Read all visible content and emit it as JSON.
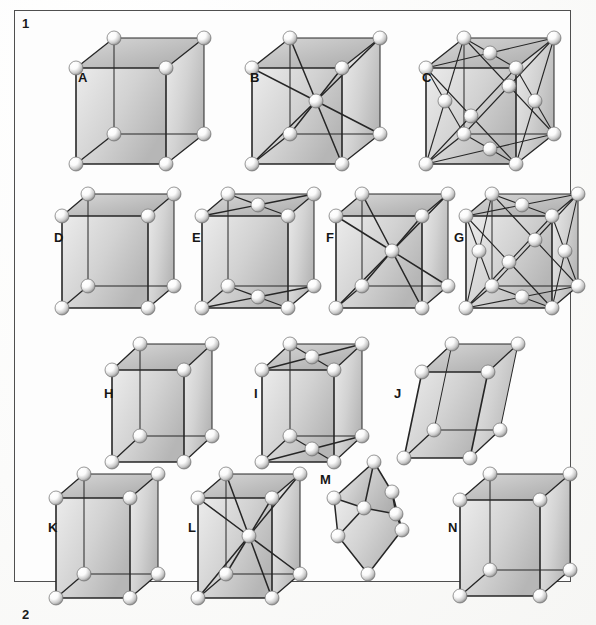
{
  "figure": {
    "number": "1",
    "next_number": "2",
    "caption_visible": false
  },
  "cells": [
    {
      "id": "A",
      "label": "A",
      "name": "simple-cubic",
      "type": "cube",
      "x": 60,
      "y": 22,
      "w": 130,
      "h": 130,
      "label_x": 18,
      "label_y": 48,
      "skew_x": 38,
      "skew_y": -30,
      "body_w": 90,
      "body_h": 96,
      "centering": "primitive",
      "bonds": "edges"
    },
    {
      "id": "B",
      "label": "B",
      "name": "body-centered-cubic",
      "type": "cube",
      "x": 236,
      "y": 22,
      "w": 130,
      "h": 130,
      "label_x": 14,
      "label_y": 48,
      "skew_x": 38,
      "skew_y": -30,
      "body_w": 90,
      "body_h": 96,
      "centering": "body",
      "bonds": "edges+body-diagonals"
    },
    {
      "id": "C",
      "label": "C",
      "name": "face-centered-cubic",
      "type": "cube",
      "x": 410,
      "y": 22,
      "w": 130,
      "h": 130,
      "label_x": 12,
      "label_y": 48,
      "skew_x": 38,
      "skew_y": -30,
      "body_w": 90,
      "body_h": 96,
      "centering": "face",
      "bonds": "edges+face-diagonals"
    },
    {
      "id": "D",
      "label": "D",
      "name": "simple-orthorhombic",
      "type": "cube",
      "x": 46,
      "y": 178,
      "w": 125,
      "h": 125,
      "label_x": 8,
      "label_y": 52,
      "skew_x": 26,
      "skew_y": -22,
      "body_w": 86,
      "body_h": 92,
      "centering": "primitive",
      "bonds": "edges"
    },
    {
      "id": "E",
      "label": "E",
      "name": "base-centered-orthorhombic",
      "type": "cube",
      "x": 186,
      "y": 178,
      "w": 125,
      "h": 125,
      "label_x": 6,
      "label_y": 52,
      "skew_x": 26,
      "skew_y": -22,
      "body_w": 86,
      "body_h": 92,
      "centering": "base",
      "bonds": "edges+base-diagonals"
    },
    {
      "id": "F",
      "label": "F",
      "name": "body-centered-orthorhombic",
      "type": "cube",
      "x": 320,
      "y": 178,
      "w": 125,
      "h": 125,
      "label_x": 6,
      "label_y": 52,
      "skew_x": 26,
      "skew_y": -22,
      "body_w": 86,
      "body_h": 92,
      "centering": "body",
      "bonds": "edges+body-diagonals"
    },
    {
      "id": "G",
      "label": "G",
      "name": "face-centered-orthorhombic",
      "type": "cube",
      "x": 450,
      "y": 178,
      "w": 125,
      "h": 125,
      "label_x": 4,
      "label_y": 52,
      "skew_x": 26,
      "skew_y": -22,
      "body_w": 86,
      "body_h": 92,
      "centering": "face",
      "bonds": "edges+face-diagonals"
    },
    {
      "id": "H",
      "label": "H",
      "name": "simple-monoclinic",
      "type": "cube",
      "x": 96,
      "y": 328,
      "w": 120,
      "h": 125,
      "label_x": 8,
      "label_y": 58,
      "skew_x": 28,
      "skew_y": -26,
      "body_w": 72,
      "body_h": 92,
      "centering": "primitive",
      "bonds": "edges"
    },
    {
      "id": "I",
      "label": "I",
      "name": "base-centered-monoclinic",
      "type": "cube",
      "x": 246,
      "y": 328,
      "w": 120,
      "h": 125,
      "label_x": 8,
      "label_y": 58,
      "skew_x": 28,
      "skew_y": -26,
      "body_w": 72,
      "body_h": 92,
      "centering": "base",
      "bonds": "edges+base-diagonals"
    },
    {
      "id": "J",
      "label": "J",
      "name": "triclinic",
      "type": "skew",
      "x": 388,
      "y": 328,
      "w": 120,
      "h": 125,
      "label_x": 6,
      "label_y": 58,
      "skew_x": 30,
      "skew_y": -28,
      "body_w": 66,
      "body_h": 86,
      "lean": 18,
      "centering": "primitive",
      "bonds": "edges"
    },
    {
      "id": "K",
      "label": "K",
      "name": "simple-tetragonal",
      "type": "cube",
      "x": 40,
      "y": 458,
      "w": 120,
      "h": 128,
      "label_x": 8,
      "label_y": 62,
      "skew_x": 28,
      "skew_y": -24,
      "body_w": 74,
      "body_h": 100,
      "centering": "primitive",
      "bonds": "edges"
    },
    {
      "id": "L",
      "label": "L",
      "name": "body-centered-tetragonal",
      "type": "cube",
      "x": 182,
      "y": 458,
      "w": 120,
      "h": 128,
      "label_x": 6,
      "label_y": 62,
      "skew_x": 28,
      "skew_y": -24,
      "body_w": 74,
      "body_h": 100,
      "centering": "body",
      "bonds": "edges+body-diagonals"
    },
    {
      "id": "M",
      "label": "M",
      "name": "rhombohedral",
      "type": "rhomb",
      "x": 318,
      "y": 452,
      "w": 110,
      "h": 130,
      "label_x": 2,
      "label_y": 20,
      "centering": "primitive",
      "bonds": "edges"
    },
    {
      "id": "N",
      "label": "N",
      "name": "hexagonal",
      "type": "cube",
      "x": 444,
      "y": 458,
      "w": 128,
      "h": 128,
      "label_x": 4,
      "label_y": 62,
      "skew_x": 30,
      "skew_y": -26,
      "body_w": 80,
      "body_h": 96,
      "centering": "primitive",
      "bonds": "edges"
    }
  ],
  "style": {
    "frame_color": "#3a3a3a",
    "edge_color": "#262626",
    "face_light": "#e6e6e6",
    "face_mid": "#d2d2d2",
    "face_dark": "#bfbfbf",
    "sphere_light": "#fbfbfb",
    "sphere_shadow": "#8e8e8e",
    "background": "#fdfdfc"
  }
}
